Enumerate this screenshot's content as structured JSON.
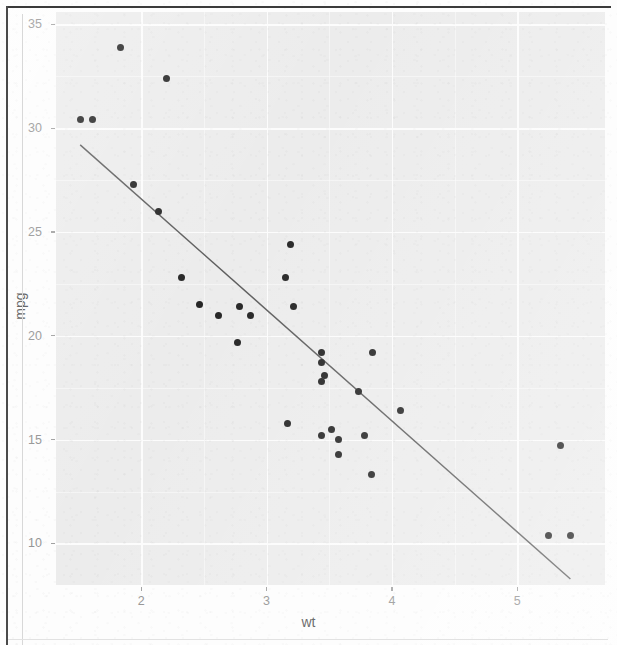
{
  "chart_data": {
    "type": "scatter",
    "title": "",
    "subtitle": "",
    "xlabel": "wt",
    "ylabel": "mpg",
    "xlim": [
      1.32,
      5.7
    ],
    "ylim": [
      8.0,
      35.6
    ],
    "x_ticks": [
      "2",
      "3",
      "4",
      "5"
    ],
    "x_tick_values": [
      2,
      3,
      4,
      5
    ],
    "y_ticks": [
      "10",
      "15",
      "20",
      "25",
      "30",
      "35"
    ],
    "y_tick_values": [
      10,
      15,
      20,
      25,
      30,
      35
    ],
    "grid": true,
    "legend": "none",
    "x": [
      2.62,
      2.875,
      2.32,
      3.215,
      3.44,
      3.46,
      3.57,
      3.19,
      3.15,
      3.44,
      3.44,
      4.07,
      3.73,
      3.78,
      5.25,
      5.424,
      5.345,
      2.2,
      1.615,
      1.835,
      2.465,
      3.52,
      3.435,
      3.84,
      3.845,
      1.935,
      2.14,
      1.513,
      3.17,
      2.77,
      3.57,
      2.78
    ],
    "y": [
      21.0,
      21.0,
      22.8,
      21.4,
      18.7,
      18.1,
      14.3,
      24.4,
      22.8,
      19.2,
      17.8,
      16.4,
      17.3,
      15.2,
      10.4,
      10.4,
      14.7,
      32.4,
      30.4,
      33.9,
      21.5,
      15.5,
      15.2,
      13.3,
      19.2,
      27.3,
      26.0,
      30.4,
      15.8,
      19.7,
      15.0,
      21.4
    ],
    "series": [
      {
        "name": "mtcars points",
        "marker": "filled-circle",
        "color": "#1a1a1a",
        "size": 7
      }
    ],
    "trendline": {
      "type": "linear",
      "method": "lm",
      "color": "#555555",
      "width": 1.4,
      "se": false,
      "intercept": 37.285,
      "slope": -5.344,
      "x_start": 1.513,
      "x_end": 5.424,
      "y_start": 29.2,
      "y_end": 8.29
    },
    "panel": {
      "background": "#ebebeb",
      "gridline_color": "#fcfcfc",
      "theme": "theme_grey"
    }
  },
  "axis": {
    "x_title": "wt",
    "y_title": "mpg",
    "tick_label_color": "#8c8c8c",
    "title_color": "#4a4a4a"
  },
  "page": {
    "border_color": "#3a3a3a",
    "background": "#fdfdfd",
    "appearance": "scanned-photocopy"
  }
}
